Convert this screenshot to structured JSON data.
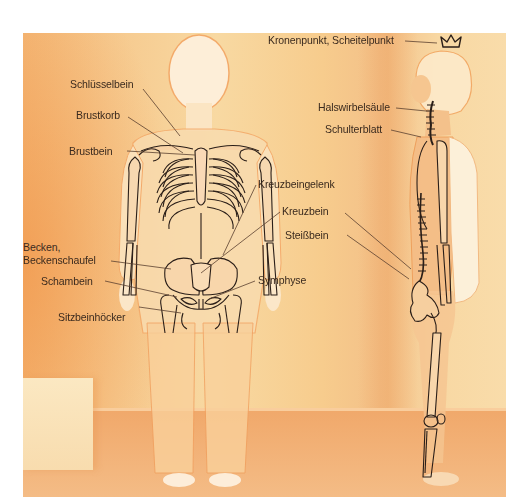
{
  "diagram": {
    "type": "anatomical-illustration",
    "views": [
      "front",
      "side"
    ],
    "colors": {
      "background_light": "#f8d9a2",
      "background_orange": "#f3b070",
      "skeleton_line": "#2a1e18",
      "label_text": "#3a2a1e",
      "leader_line": "#5a4030"
    },
    "labels": {
      "kronenpunkt": "Kronenpunkt, Scheitelpunkt",
      "halswirbelsaeule": "Halswirbelsäule",
      "schulterblatt": "Schulterblatt",
      "schluesselbein": "Schlüsselbein",
      "brustkorb": "Brustkorb",
      "brustbein": "Brustbein",
      "kreuzbeingelenk": "Kreuzbeingelenk",
      "kreuzbein": "Kreuzbein",
      "steissbein": "Steißbein",
      "becken_line1": "Becken,",
      "becken_line2": "Beckenschaufel",
      "schambein": "Schambein",
      "symphyse": "Symphyse",
      "sitzbeinhoecker": "Sitzbeinhöcker"
    },
    "icons": {
      "crown": "crown-icon"
    }
  }
}
